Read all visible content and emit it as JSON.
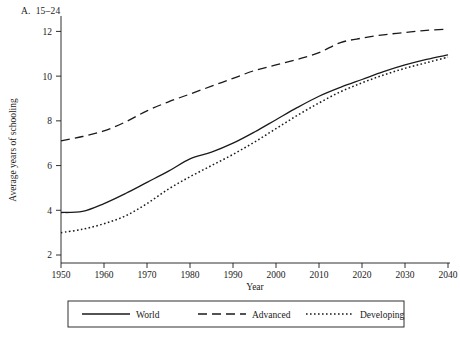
{
  "chart_data": {
    "type": "line",
    "title_letter": "A.",
    "title_text": "15–24",
    "xlabel": "Year",
    "ylabel": "Average years of schooling",
    "xlim": [
      1950,
      2040
    ],
    "ylim": [
      2,
      12.6
    ],
    "xticks": [
      1950,
      1960,
      1970,
      1980,
      1990,
      2000,
      2010,
      2020,
      2030,
      2040
    ],
    "yticks": [
      2,
      4,
      6,
      8,
      10,
      12
    ],
    "grid": false,
    "legend_position": "bottom-outside",
    "legend_entries": [
      {
        "name": "World",
        "style": "solid"
      },
      {
        "name": "Advanced",
        "style": "dashed"
      },
      {
        "name": "Developing",
        "style": "dotted"
      }
    ],
    "x": [
      1950,
      1955,
      1960,
      1965,
      1970,
      1975,
      1980,
      1985,
      1990,
      1995,
      2000,
      2005,
      2010,
      2015,
      2020,
      2025,
      2030,
      2035,
      2040
    ],
    "series": [
      {
        "name": "World",
        "style": "solid",
        "color": "#1a1a1a",
        "values": [
          3.9,
          3.95,
          4.3,
          4.75,
          5.25,
          5.75,
          6.3,
          6.6,
          7.0,
          7.5,
          8.05,
          8.6,
          9.1,
          9.5,
          9.85,
          10.2,
          10.5,
          10.75,
          10.95
        ]
      },
      {
        "name": "Advanced",
        "style": "dashed",
        "color": "#1a1a1a",
        "values": [
          7.1,
          7.3,
          7.55,
          7.95,
          8.45,
          8.85,
          9.2,
          9.55,
          9.9,
          10.25,
          10.5,
          10.75,
          11.05,
          11.5,
          11.7,
          11.85,
          11.95,
          12.05,
          12.1
        ]
      },
      {
        "name": "Developing",
        "style": "dotted",
        "color": "#1a1a1a",
        "values": [
          3.0,
          3.15,
          3.4,
          3.75,
          4.3,
          4.95,
          5.5,
          6.0,
          6.5,
          7.05,
          7.65,
          8.25,
          8.8,
          9.3,
          9.7,
          10.05,
          10.35,
          10.6,
          10.85
        ]
      }
    ]
  }
}
